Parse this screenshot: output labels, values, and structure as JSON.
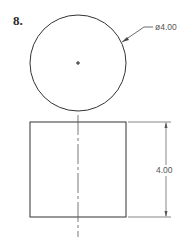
{
  "problem": {
    "number": "8."
  },
  "top_view": {
    "shape": "circle",
    "center_mark": "+",
    "diameter_label": "ø4.00"
  },
  "front_view": {
    "shape": "rectangle",
    "centerline": "dash-dot chain line",
    "height_label": "4.00"
  },
  "colors": {
    "outline": "#333333",
    "dimension": "#555555",
    "background": "#ffffff"
  }
}
